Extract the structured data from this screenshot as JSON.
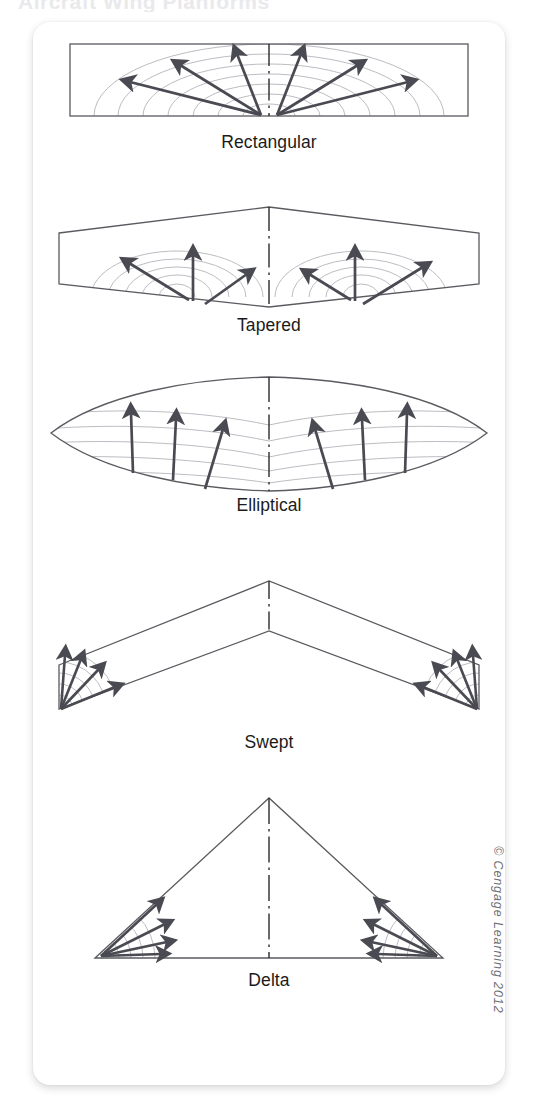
{
  "figure": {
    "cut_off_heading": "Aircraft Wing Planforms",
    "copyright": "© Cengage Learning 2012",
    "colors": {
      "outline": "#5a5a60",
      "arrow": "#4a4a52",
      "streamline": "#b9b9c0",
      "centerline": "#2b2b2b",
      "caption": "#1b1b1b",
      "card": "#ffffff",
      "page": "#ffffff"
    },
    "panels": [
      {
        "id": "rectangular",
        "label": "Rectangular",
        "shape": "rectangle",
        "description": "Constant-chord rectangular wing with semicircular spanwise flow arcs radiating from the root centerline",
        "arrow_count": 6,
        "arc_count": 7,
        "arrow_angles_deg": [
          160,
          131,
          101,
          79,
          49,
          20
        ]
      },
      {
        "id": "tapered",
        "label": "Tapered",
        "shape": "trapezoid",
        "description": "Tapered wing with swept leading edge; flow arcs emanate from each root trailing edge corner",
        "arrow_count": 3,
        "arc_count": 5,
        "arrow_angles_deg": [
          140,
          92,
          42
        ]
      },
      {
        "id": "elliptical",
        "label": "Elliptical",
        "shape": "ellipse",
        "description": "Elliptical planform with evenly distributed near-vertical lift arrows and smooth curved streamlines",
        "arrow_count": 3,
        "arc_count": 5,
        "arrow_angles_deg": [
          90,
          88,
          72
        ]
      },
      {
        "id": "swept",
        "label": "Swept",
        "shape": "chevron",
        "description": "Swept-back wing; flow concentrates into fans at the outboard wingtips",
        "arrow_count": 4,
        "arc_count": 5,
        "arrow_angles_deg": [
          96,
          76,
          56,
          36
        ]
      },
      {
        "id": "delta",
        "label": "Delta",
        "shape": "triangle",
        "description": "Delta planform triangle with wingtip flow fans near each outer apex",
        "arrow_count": 4,
        "arc_count": 5,
        "arrow_angles_deg": [
          58,
          40,
          22,
          5
        ]
      }
    ]
  }
}
